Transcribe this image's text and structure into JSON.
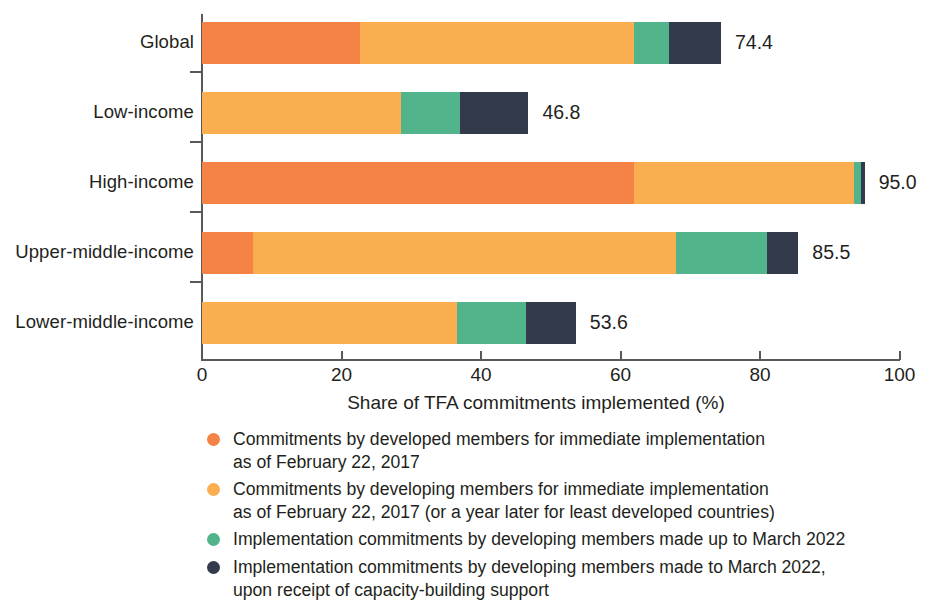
{
  "chart_data": {
    "type": "bar",
    "orientation": "horizontal",
    "stacked": true,
    "title": "",
    "xlabel": "Share of TFA commitments implemented (%)",
    "ylabel": "",
    "xlim": [
      0,
      100
    ],
    "xticks": [
      0,
      20,
      40,
      60,
      80,
      100
    ],
    "xtick_labels": [
      "0",
      "20",
      "40",
      "60",
      "80",
      "100"
    ],
    "grid": false,
    "legend_position": "below",
    "categories": [
      "Global",
      "Low-income",
      "High-income",
      "Upper-middle-income",
      "Lower-middle-income"
    ],
    "series": [
      {
        "name": "Commitments by developed members for immediate implementation as of February 22, 2017",
        "color": "#F58345",
        "values": [
          22.7,
          0.0,
          62.0,
          7.3,
          0.0
        ]
      },
      {
        "name": "Commitments by developing members for immediate implementation as of February 22, 2017 (or a year later for least developed countries)",
        "color": "#FBAE4F",
        "values": [
          39.3,
          28.5,
          31.5,
          60.7,
          36.5
        ]
      },
      {
        "name": "Implementation commitments by developing members made up to March 2022",
        "color": "#52B48B",
        "values": [
          5.0,
          8.5,
          1.0,
          13.0,
          10.0
        ]
      },
      {
        "name": "Implementation commitments by developing members made to March 2022, upon receipt of capacity-building support",
        "color": "#333A4C",
        "values": [
          7.4,
          9.8,
          0.5,
          4.5,
          7.1
        ]
      }
    ],
    "totals": [
      74.4,
      46.8,
      95.0,
      85.5,
      53.6
    ],
    "total_labels": [
      "74.4",
      "46.8",
      "95.0",
      "85.5",
      "53.6"
    ]
  },
  "axis": {
    "x_title": "Share of TFA commitments implemented (%)"
  },
  "legend": {
    "items": [
      {
        "color": "#F58345",
        "line1": "Commitments by developed members for immediate implementation",
        "line2": "as of February 22, 2017"
      },
      {
        "color": "#FBAE4F",
        "line1": "Commitments by developing members for immediate implementation",
        "line2": "as of February 22, 2017 (or a year later for least developed countries)"
      },
      {
        "color": "#52B48B",
        "line1": "Implementation commitments by developing members made up to March 2022",
        "line2": ""
      },
      {
        "color": "#333A4C",
        "line1": "Implementation commitments by developing members made to March 2022,",
        "line2": "upon receipt of capacity-building support"
      }
    ]
  }
}
